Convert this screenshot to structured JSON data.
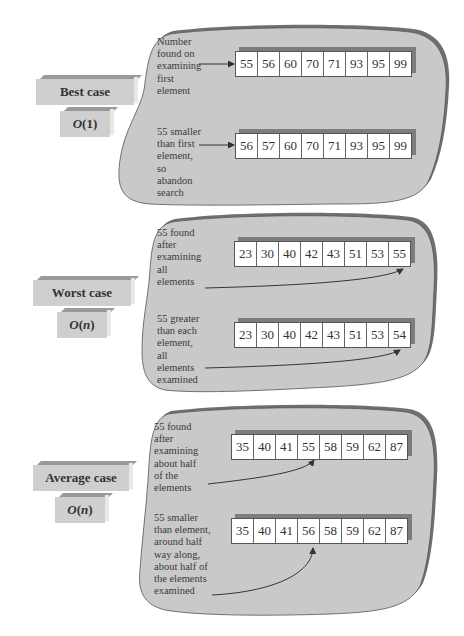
{
  "diagram": {
    "colors": {
      "bubble_fill": "#c9c9c9",
      "bubble_shadow": "#6f6f6f",
      "label_fill": "#cfcfcf",
      "cell_fill": "#ffffff",
      "array_shadow": "#7d7d7d"
    },
    "cases": [
      {
        "name": "Best case",
        "complexity_prefix": "O",
        "complexity_arg": "1",
        "examples": [
          {
            "note": "Number\nfound on\nexamining\nfirst\nelement",
            "values": [
              "55",
              "56",
              "60",
              "70",
              "71",
              "93",
              "95",
              "99"
            ],
            "arrow_target_index": 0
          },
          {
            "note": "55 smaller\nthan first\nelement,\nso\nabandon\nsearch",
            "values": [
              "56",
              "57",
              "60",
              "70",
              "71",
              "93",
              "95",
              "99"
            ],
            "arrow_target_index": 0
          }
        ]
      },
      {
        "name": "Worst case",
        "complexity_prefix": "O",
        "complexity_arg": "n",
        "examples": [
          {
            "note": "55 found\nafter\nexamining\nall\nelements",
            "values": [
              "23",
              "30",
              "40",
              "42",
              "43",
              "51",
              "53",
              "55"
            ],
            "arrow_target_index": 7
          },
          {
            "note": "55 greater\nthan each\nelement,\nall\nelements\nexamined",
            "values": [
              "23",
              "30",
              "40",
              "42",
              "43",
              "51",
              "53",
              "54"
            ],
            "arrow_target_index": 7
          }
        ]
      },
      {
        "name": "Average case",
        "complexity_prefix": "O",
        "complexity_arg": "n",
        "examples": [
          {
            "note": "55 found\nafter\nexamining\nabout half\nof the\nelements",
            "values": [
              "35",
              "40",
              "41",
              "55",
              "58",
              "59",
              "62",
              "87"
            ],
            "arrow_target_index": 3
          },
          {
            "note": "55 smaller\nthan element,\naround half\nway along,\nabout half of\nthe elements\nexamined",
            "values": [
              "35",
              "40",
              "41",
              "56",
              "58",
              "59",
              "62",
              "87"
            ],
            "arrow_target_index": 3
          }
        ]
      }
    ]
  }
}
